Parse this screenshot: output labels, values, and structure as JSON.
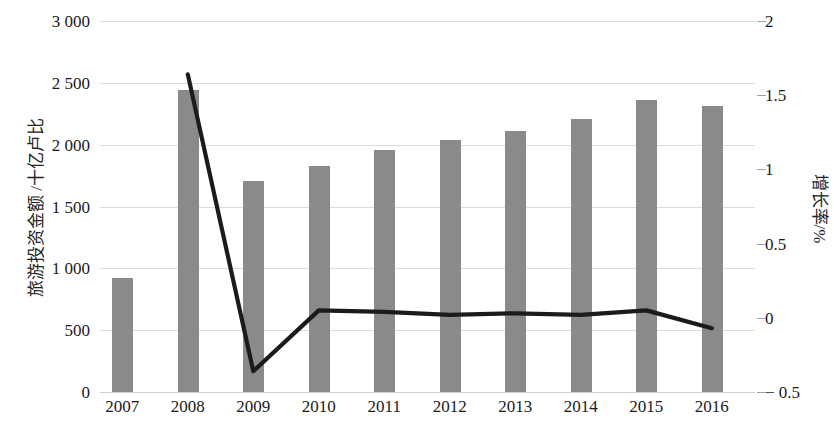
{
  "axes": {
    "y_left_title": "旅游投资金额 /十亿卢比",
    "y_right_title": "增长率/%",
    "y_left_ticks": [
      "3 000",
      "2 500",
      "2 000",
      "1 500",
      "1 000",
      "500",
      "0"
    ],
    "y_right_ticks": [
      "2",
      "1.5",
      "1",
      "0.5",
      "0",
      "− 0.5"
    ],
    "x_ticks": [
      "2007",
      "2008",
      "2009",
      "2010",
      "2011",
      "2012",
      "2013",
      "2014",
      "2015",
      "2016"
    ]
  },
  "colors": {
    "bar": "#8a8a8a",
    "line": "#1b1b1b",
    "grid": "#d7dde4",
    "text": "#1a1a1a"
  },
  "chart_data": {
    "type": "bar",
    "title": "",
    "subtitle": "",
    "xlabel": "",
    "ylabel": "旅游投资金额 /十亿卢比",
    "y2label": "增长率/%",
    "categories": [
      "2007",
      "2008",
      "2009",
      "2010",
      "2011",
      "2012",
      "2013",
      "2014",
      "2015",
      "2016"
    ],
    "ylim": [
      0,
      3000
    ],
    "y2lim": [
      -0.5,
      2
    ],
    "yticks": [
      0,
      500,
      1000,
      1500,
      2000,
      2500,
      3000
    ],
    "y2ticks": [
      -0.5,
      0,
      0.5,
      1,
      1.5,
      2
    ],
    "grid": true,
    "legend": "none",
    "series": [
      {
        "name": "旅游投资金额",
        "type": "bar",
        "axis": "left",
        "unit": "十亿卢比",
        "values": [
          920,
          2445,
          1710,
          1830,
          1960,
          2040,
          2110,
          2210,
          2360,
          2310
        ]
      },
      {
        "name": "增长率",
        "type": "line",
        "axis": "right",
        "unit": "%",
        "x": [
          "2008",
          "2009",
          "2010",
          "2011",
          "2012",
          "2013",
          "2014",
          "2015",
          "2016"
        ],
        "values": [
          1.64,
          -0.36,
          0.05,
          0.04,
          0.02,
          0.03,
          0.02,
          0.05,
          -0.07
        ]
      }
    ]
  }
}
